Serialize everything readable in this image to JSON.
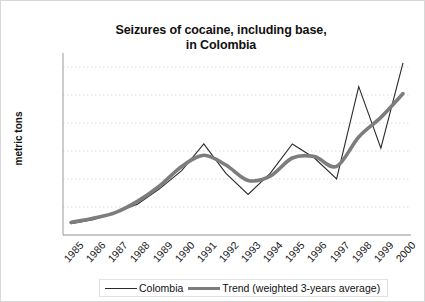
{
  "chart_data": {
    "type": "line",
    "title": "Seizures of cocaine, including base, in Colombia",
    "title_line1": "Seizures of cocaine, including base,",
    "title_line2": "in Colombia",
    "xlabel": "",
    "ylabel": "metric tons",
    "ylim": [
      0,
      130
    ],
    "y_ticks": [
      0,
      20,
      40,
      60,
      80,
      100,
      120
    ],
    "grid": true,
    "grid_axis": "y",
    "legend_position": "bottom",
    "categories": [
      "1985",
      "1986",
      "1987",
      "1988",
      "1989",
      "1990",
      "1991",
      "1992",
      "1993",
      "1994",
      "1995",
      "1996",
      "1997",
      "1998",
      "1999",
      "2000"
    ],
    "series": [
      {
        "name": "Colombia",
        "style": "thin",
        "color": "#2a2a2a",
        "values": [
          8,
          11,
          16,
          22,
          33,
          46,
          65,
          44,
          29,
          44,
          65,
          55,
          40,
          106,
          62,
          123
        ]
      },
      {
        "name": "Trend (weighted 3-years average)",
        "style": "thick",
        "color": "#7d7d7d",
        "values": [
          9,
          12,
          16,
          24,
          35,
          49,
          57,
          50,
          39,
          42,
          55,
          56,
          49,
          70,
          84,
          101
        ]
      }
    ],
    "colors": {
      "colombia": "#2a2a2a",
      "trend": "#7d7d7d",
      "grid": "#d9d9d9",
      "axis": "#9a9a9a",
      "text": "#111111",
      "background": "#ffffff"
    }
  },
  "legend": {
    "colombia_label": "Colombia",
    "trend_label": "Trend (weighted 3-years average)"
  }
}
